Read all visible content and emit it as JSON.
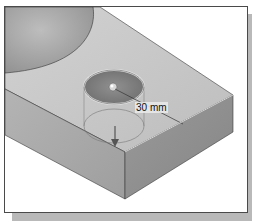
{
  "viewport": {
    "model": {
      "feature": "hole",
      "dimension": {
        "label": "30 mm",
        "value": 30,
        "unit": "mm"
      }
    }
  },
  "colors": {
    "background": "#ffffff",
    "frame_border": "#4a4a4a",
    "shadow": "#b9b9b9",
    "top_face": "#c8c8c8",
    "front_face": "#a6a6a6",
    "side_face": "#8f8f8f",
    "sphere": "#a8a8a8"
  }
}
